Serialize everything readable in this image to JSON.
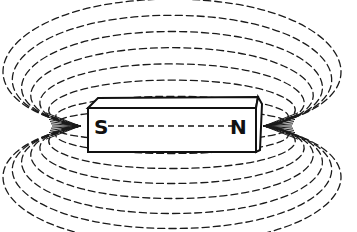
{
  "diagram": {
    "magnet": {
      "south_label": "S",
      "north_label": "N",
      "body": {
        "x": 88,
        "y": 108,
        "width": 168,
        "height": 44,
        "depth": 10
      }
    },
    "colors": {
      "ink": "#1a1a1a",
      "background": "#ffffff"
    },
    "field_lines": {
      "center_y": 126,
      "left_pole_x": 80,
      "right_pole_x": 264,
      "loops": [
        {
          "rx_top": 95,
          "ry_top": 12
        },
        {
          "rx_top": 100,
          "ry_top": 22
        },
        {
          "rx_top": 108,
          "ry_top": 34
        },
        {
          "rx_top": 118,
          "ry_top": 46
        },
        {
          "rx_top": 128,
          "ry_top": 58
        },
        {
          "rx_top": 138,
          "ry_top": 70
        },
        {
          "rx_top": 148,
          "ry_top": 82
        },
        {
          "rx_top": 158,
          "ry_top": 94
        }
      ]
    }
  }
}
